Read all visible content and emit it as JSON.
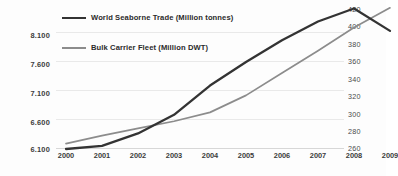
{
  "chart_data": {
    "type": "line",
    "title": "",
    "xlabel": "",
    "ylabel": "",
    "grid": true,
    "legend_position": "top-left",
    "x": [
      "2000",
      "2001",
      "2002",
      "2003",
      "2004",
      "2005",
      "2006",
      "2007",
      "2008",
      "2009"
    ],
    "categories": [
      "2000",
      "2001",
      "2002",
      "2003",
      "2004",
      "2005",
      "2006",
      "2007",
      "2008",
      "2009"
    ],
    "series": [
      {
        "name": "World Seaborne Trade (Million tonnes)",
        "axis": "left",
        "color": "#333333",
        "values": [
          6100,
          6150,
          6350,
          6650,
          7120,
          7500,
          7850,
          8150,
          8360,
          8000
        ]
      },
      {
        "name": "Bulk Carrier Fleet (Million DWT)",
        "axis": "right",
        "color": "#8c8c8c",
        "values": [
          266,
          275,
          283,
          291,
          301,
          320,
          345,
          370,
          396,
          418
        ]
      }
    ],
    "left_axis": {
      "ticks": [
        "6.100",
        "6.600",
        "7.100",
        "7.600",
        "8.100"
      ],
      "tick_values": [
        6100,
        6600,
        7100,
        7600,
        8100
      ],
      "ylim": [
        6100,
        8400
      ]
    },
    "right_axis": {
      "ticks": [
        "260",
        "280",
        "300",
        "320",
        "340",
        "360",
        "380",
        "400",
        "420"
      ],
      "tick_values": [
        260,
        280,
        300,
        320,
        340,
        360,
        380,
        400,
        420
      ],
      "ylim": [
        260,
        420
      ]
    }
  },
  "legend": {
    "items": [
      {
        "label": "World Seaborne Trade (Million tonnes)",
        "color": "#333333",
        "thickness": "2.6px"
      },
      {
        "label": "Bulk Carrier Fleet (Million DWT)",
        "color": "#8c8c8c",
        "thickness": "1.8px"
      }
    ]
  },
  "colors": {
    "background": "#fdfdfd",
    "gridline": "#e9e9e9",
    "axis_text": "#3b3b3b",
    "series_dark": "#333333",
    "series_light": "#8c8c8c"
  }
}
